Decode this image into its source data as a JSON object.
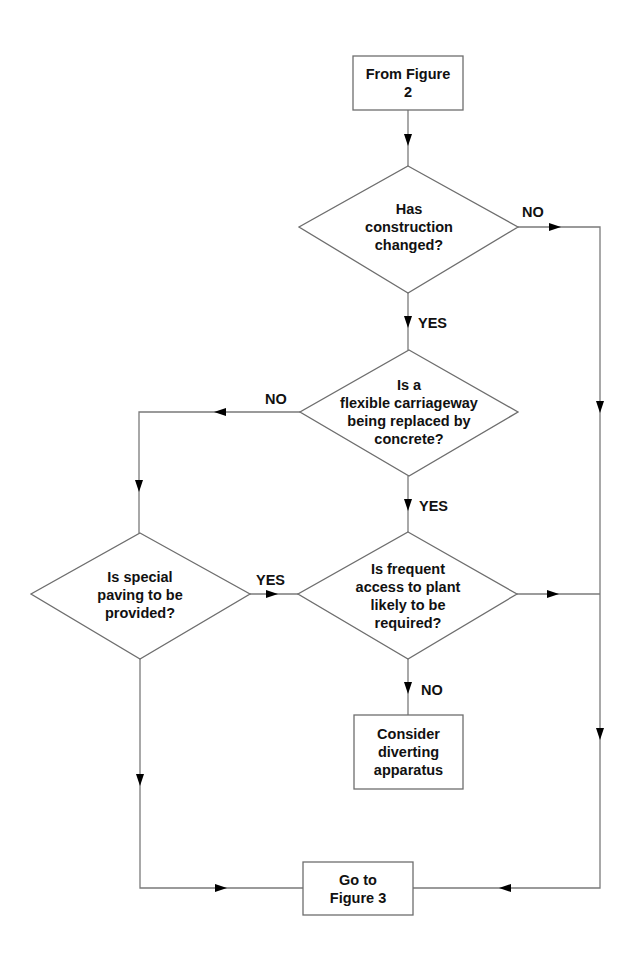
{
  "diagram": {
    "type": "flowchart",
    "nodes": [
      {
        "id": "start",
        "shape": "rect",
        "text": "From Figure\n2"
      },
      {
        "id": "q1",
        "shape": "diamond",
        "text": "Has\nconstruction\nchanged?"
      },
      {
        "id": "q2",
        "shape": "diamond",
        "text": "Is a\nflexible carriageway\nbeing replaced by\nconcrete?"
      },
      {
        "id": "q3",
        "shape": "diamond",
        "text": "Is special\npaving to be\nprovided?"
      },
      {
        "id": "q4",
        "shape": "diamond",
        "text": "Is frequent\naccess to plant\nlikely to be\nrequired?"
      },
      {
        "id": "action",
        "shape": "rect",
        "text": "Consider\ndiverting\napparatus"
      },
      {
        "id": "end",
        "shape": "rect",
        "text": "Go to\nFigure 3"
      }
    ],
    "edges": [
      {
        "from": "start",
        "to": "q1",
        "label": ""
      },
      {
        "from": "q1",
        "to": "q2",
        "label": "YES"
      },
      {
        "from": "q1",
        "to": "end",
        "label": "NO"
      },
      {
        "from": "q2",
        "to": "q4",
        "label": "YES"
      },
      {
        "from": "q2",
        "to": "q3",
        "label": "NO"
      },
      {
        "from": "q3",
        "to": "q4",
        "label": "YES"
      },
      {
        "from": "q3",
        "to": "end",
        "label": ""
      },
      {
        "from": "q4",
        "to": "action",
        "label": "NO"
      },
      {
        "from": "q4",
        "to": "end",
        "label": ""
      }
    ],
    "labels": {
      "q1_no": "NO",
      "q1_yes": "YES",
      "q2_no": "NO",
      "q2_yes": "YES",
      "q3_yes": "YES",
      "q4_no": "NO"
    }
  }
}
